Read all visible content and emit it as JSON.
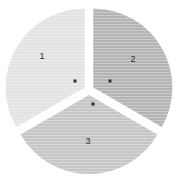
{
  "chart_data": {
    "type": "pie",
    "title": "",
    "subtitle": "",
    "xlabel": "",
    "ylabel": "",
    "legend_position": "none",
    "grid": false,
    "background_color": "#ffffff",
    "exploded": true,
    "categories": [
      "1",
      "2",
      "3"
    ],
    "values": [
      1,
      1,
      1
    ],
    "percentages": [
      33.3,
      33.3,
      33.3
    ],
    "slice_angles_deg": [
      120,
      120,
      120
    ],
    "slices": [
      {
        "label": "1",
        "value": 1,
        "percent": 33.3,
        "color": "#e3e3e3",
        "start_angle_deg": 240,
        "end_angle_deg": 360,
        "label_x": 42,
        "label_y": 57,
        "dot_x": 75,
        "dot_y": 81
      },
      {
        "label": "2",
        "value": 1,
        "percent": 33.3,
        "color": "#b4b4b4",
        "start_angle_deg": 0,
        "end_angle_deg": 120,
        "label_x": 133,
        "label_y": 60,
        "dot_x": 110,
        "dot_y": 81
      },
      {
        "label": "3",
        "value": 1,
        "percent": 33.3,
        "color": "#c6c6c6",
        "start_angle_deg": 120,
        "end_angle_deg": 240,
        "label_x": 88,
        "label_y": 142,
        "dot_x": 93,
        "dot_y": 104
      }
    ],
    "geometry": {
      "center_x": 89,
      "center_y": 90,
      "radius": 79,
      "explode_offset": 5
    },
    "texture": "horizontal-stripes",
    "dot_color": "#2f2f2f",
    "label_color": "#2b2b2b"
  }
}
